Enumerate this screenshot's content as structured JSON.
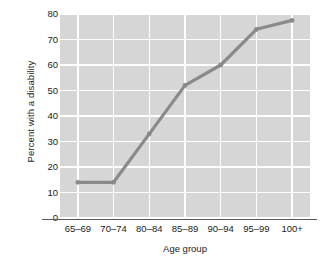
{
  "chart_data": {
    "type": "line",
    "title": "",
    "subtitle": "",
    "xlabel": "Age group",
    "ylabel": "Percent with a disability",
    "categories": [
      "65–69",
      "70–74",
      "80–84",
      "85–89",
      "90–94",
      "95–99",
      "100+"
    ],
    "values": [
      14,
      14,
      33,
      52,
      60,
      74,
      77.5
    ],
    "series": [
      {
        "name": "Percent with a disability",
        "values": [
          14,
          14,
          33,
          52,
          60,
          74,
          77.5
        ]
      }
    ],
    "ylim": [
      0,
      80
    ],
    "yticks": [
      0,
      10,
      20,
      30,
      40,
      50,
      60,
      70,
      80
    ],
    "ytick_labels": [
      "0",
      "10",
      "20",
      "30",
      "40",
      "50",
      "60",
      "70",
      "80"
    ],
    "grid": true,
    "grid_color": "#ffffff",
    "legend": "none",
    "plot_background": "#d6d6d6",
    "line_color": "#8a8a8a",
    "marker_color": "#8a8a8a",
    "axis_color": "#55595c",
    "text_color": "#1b1b1b"
  }
}
